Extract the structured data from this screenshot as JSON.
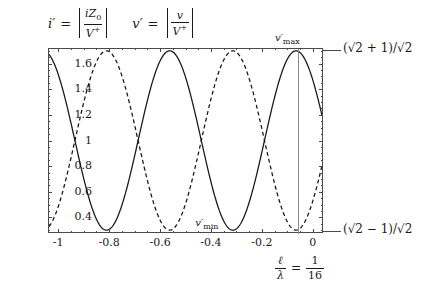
{
  "figure": {
    "title": "",
    "formulas": {
      "current": {
        "lhs": "i",
        "lhs_prime": "′",
        "equals": "=",
        "numerator": "iZ",
        "numerator_sub": "0",
        "denominator": "V",
        "denominator_sup": "+"
      },
      "voltage": {
        "lhs": "v",
        "lhs_prime": "′",
        "equals": "=",
        "numerator": "v",
        "denominator": "V",
        "denominator_sup": "+"
      }
    },
    "annotations": {
      "vmax_label": "v",
      "vmax_prime": "′",
      "vmax_sub": "max",
      "vmin_label": "v",
      "vmin_prime": "′",
      "vmin_sub": "min",
      "upper_right_label": "(√2 + 1)/√2",
      "lower_right_label": "(√2 − 1)/√2",
      "ratio_numerator_sym": "ℓ",
      "ratio_denominator_sym": "λ",
      "ratio_equals": "=",
      "ratio_value_num": "1",
      "ratio_value_den": "16"
    },
    "colors": {
      "axis": "#4a4a4a",
      "curve_solid": "#1a1a1a",
      "curve_dashed": "#1a1a1a",
      "marker_line": "#8a8a8a",
      "background": "#ffffff"
    }
  },
  "chart_data": {
    "type": "line",
    "title": "",
    "xlabel": "",
    "ylabel": "",
    "xlim": [
      -1.04,
      0.04
    ],
    "ylim": [
      0.2785,
      1.7215
    ],
    "grid": false,
    "legend_position": "none",
    "xticks": [
      -1,
      -0.8,
      -0.6,
      -0.4,
      -0.2,
      0
    ],
    "xtick_labels": [
      "-1",
      "-0.8",
      "-0.6",
      "-0.4",
      "-0.2",
      "0"
    ],
    "yticks": [
      0.4,
      0.6,
      0.8,
      1,
      1.2,
      1.4,
      1.6
    ],
    "ytick_labels": [
      "0.4",
      "0.6",
      "0.8",
      "1",
      "1.2",
      "1.4",
      "1.6"
    ],
    "reference_values": {
      "v_max": 1.7071,
      "v_min": 0.2929,
      "v_max_position_x": -0.0625,
      "ell_over_lambda": 0.0625
    },
    "series": [
      {
        "name": "v'",
        "style": "solid",
        "period": 0.5,
        "amplitude": 0.7071,
        "offset": 1.0,
        "phase_x_at_max": -0.0625,
        "description": "v' = |1 + Gamma e^{j2bz}| scaled; maxima at x = -0.0625, -0.5625; minima at x = -0.3125, -0.8125",
        "x": [
          -1.0,
          -0.95,
          -0.9,
          -0.85,
          -0.8125,
          -0.8,
          -0.75,
          -0.7,
          -0.65,
          -0.5625,
          -0.5,
          -0.45,
          -0.4,
          -0.35,
          -0.3125,
          -0.3,
          -0.25,
          -0.2,
          -0.15,
          -0.1,
          -0.0625,
          -0.05,
          0.0
        ],
        "y": [
          1.6,
          1.37,
          1.0,
          0.55,
          0.293,
          0.31,
          0.62,
          1.06,
          1.43,
          1.707,
          1.66,
          1.42,
          1.03,
          0.58,
          0.293,
          0.3,
          0.58,
          1.03,
          1.42,
          1.66,
          1.707,
          1.7,
          1.6
        ]
      },
      {
        "name": "i'",
        "style": "dashed",
        "period": 0.5,
        "amplitude": 0.7071,
        "offset": 1.0,
        "phase_x_at_max": -0.3125,
        "description": "i' = |1 - Gamma e^{j2bz}| scaled; maxima at x = -0.3125, -0.8125; minima at x = -0.0625, -0.5625",
        "x": [
          -1.0,
          -0.95,
          -0.9,
          -0.85,
          -0.8125,
          -0.8,
          -0.75,
          -0.7,
          -0.65,
          -0.5625,
          -0.5,
          -0.45,
          -0.4,
          -0.35,
          -0.3125,
          -0.3,
          -0.25,
          -0.2,
          -0.15,
          -0.1,
          -0.0625,
          -0.05,
          0.0
        ],
        "y": [
          0.7,
          0.95,
          1.31,
          1.63,
          1.707,
          1.7,
          1.45,
          1.07,
          0.63,
          0.293,
          0.33,
          0.63,
          1.03,
          1.47,
          1.707,
          1.7,
          1.43,
          1.03,
          0.6,
          0.33,
          0.293,
          0.3,
          0.7
        ]
      }
    ]
  }
}
